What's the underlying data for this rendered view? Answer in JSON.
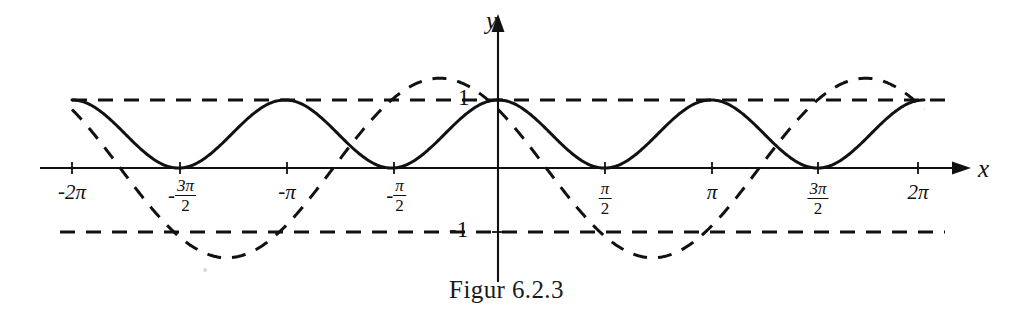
{
  "figure": {
    "caption": "Figur 6.2.3",
    "background_color": "#ffffff",
    "ink_color": "#111111",
    "width": 1013,
    "height": 322
  },
  "axes": {
    "x_axis_label": "x",
    "y_axis_label": "y",
    "origin_px": {
      "x": 498,
      "y": 168
    },
    "px_per_half_pi": 106.5,
    "px_per_unit_y": 68,
    "x_ticks": [
      {
        "value": "-2pi",
        "label_parts": {
          "sign": "-",
          "main": "2π"
        },
        "px": 72
      },
      {
        "value": "-3pi/2",
        "label_parts": {
          "sign": "-",
          "numerator": "3π",
          "denominator": "2"
        },
        "px": 180
      },
      {
        "value": "-pi",
        "label_parts": {
          "sign": "-",
          "main": "π"
        },
        "px": 287
      },
      {
        "value": "-pi/2",
        "label_parts": {
          "sign": "-",
          "numerator": "π",
          "denominator": "2"
        },
        "px": 394
      },
      {
        "value": "pi/2",
        "label_parts": {
          "sign": "",
          "numerator": "π",
          "denominator": "2"
        },
        "px": 605
      },
      {
        "value": "pi",
        "label_parts": {
          "sign": "",
          "main": "π"
        },
        "px": 712
      },
      {
        "value": "3pi/2",
        "label_parts": {
          "sign": "",
          "numerator": "3π",
          "denominator": "2"
        },
        "px": 818
      },
      {
        "value": "2pi",
        "label_parts": {
          "sign": "",
          "main": "2π"
        },
        "px": 918
      }
    ],
    "y_labels": [
      {
        "text": "1",
        "value": 1,
        "px_y": 100
      },
      {
        "text": "-1",
        "value": -1,
        "px_y": 232
      }
    ]
  },
  "guides": {
    "upper": {
      "y_value": 1,
      "style": "dashed",
      "x_from_px": 72,
      "x_to_px": 945
    },
    "lower": {
      "y_value": -1,
      "style": "dashed",
      "x_from_px": 60,
      "x_to_px": 945
    }
  },
  "chart_data": {
    "type": "line",
    "title": "Figur 6.2.3",
    "xlabel": "x",
    "ylabel": "y",
    "xlim": [
      -6.2832,
      6.2832
    ],
    "ylim": [
      -1.45,
      1.45
    ],
    "xticks": [
      -6.2832,
      -4.7124,
      -3.1416,
      -1.5708,
      1.5708,
      3.1416,
      4.7124,
      6.2832
    ],
    "xticklabels": [
      "-2π",
      "-3π/2",
      "-π",
      "-π/2",
      "π/2",
      "π",
      "3π/2",
      "2π"
    ],
    "yticks": [
      -1,
      1
    ],
    "yticklabels": [
      "-1",
      "1"
    ],
    "grid": false,
    "legend": "none",
    "reference_lines": [
      {
        "y": 1,
        "style": "dashed"
      },
      {
        "y": -1,
        "style": "dashed"
      }
    ],
    "series": [
      {
        "name": "solid-curve",
        "style": "solid",
        "expression": "cos(x)^2",
        "period": 3.1416,
        "amplitude": 1,
        "range": [
          0,
          1
        ],
        "x": [
          -6.2832,
          -5.8905,
          -5.4978,
          -5.1051,
          -4.7124,
          -4.3197,
          -3.927,
          -3.5343,
          -3.1416,
          -2.7489,
          -2.3562,
          -1.9635,
          -1.5708,
          -1.1781,
          -0.7854,
          -0.3927,
          0,
          0.3927,
          0.7854,
          1.1781,
          1.5708,
          1.9635,
          2.3562,
          2.7489,
          3.1416,
          3.5343,
          3.927,
          4.3197,
          4.7124,
          5.1051,
          5.4978,
          5.8905,
          6.2832
        ],
        "y": [
          1,
          0.854,
          0.5,
          0.146,
          0,
          0.146,
          0.5,
          0.854,
          1,
          0.854,
          0.5,
          0.146,
          0,
          0.146,
          0.5,
          0.854,
          1,
          0.854,
          0.5,
          0.146,
          0,
          0.146,
          0.5,
          0.854,
          1,
          0.854,
          0.5,
          0.146,
          0,
          0.146,
          0.5,
          0.854,
          1
        ]
      },
      {
        "name": "dashed-curve",
        "style": "dashed",
        "expression": "1.32*cos(x + 0.86)",
        "period": 6.2832,
        "amplitude": 1.32,
        "range": [
          -1.32,
          1.32
        ],
        "x": [
          -6.2832,
          -5.8905,
          -5.4978,
          -5.1051,
          -4.7124,
          -4.3197,
          -3.927,
          -3.5343,
          -3.1416,
          -2.7489,
          -2.3562,
          -1.9635,
          -1.5708,
          -1.1781,
          -0.7854,
          -0.3927,
          0,
          0.3927,
          0.7854,
          1.1781,
          1.5708,
          1.9635,
          2.3562,
          2.7489,
          3.1416,
          3.5343,
          3.927,
          4.3197,
          4.7124,
          5.1051,
          5.4978,
          5.8905,
          6.2832
        ],
        "y": [
          1.0,
          1.24,
          1.32,
          1.23,
          0.99,
          0.62,
          0.18,
          -0.29,
          -0.72,
          -1.08,
          -1.29,
          -1.32,
          -1.19,
          -0.9,
          -0.5,
          -0.05,
          1.0,
          1.24,
          1.32,
          1.23,
          0.99,
          0.62,
          0.18,
          -0.29,
          -0.72,
          -1.08,
          -1.29,
          -1.32,
          -1.19,
          -0.9,
          -0.5,
          -0.05,
          1.0
        ]
      }
    ]
  }
}
